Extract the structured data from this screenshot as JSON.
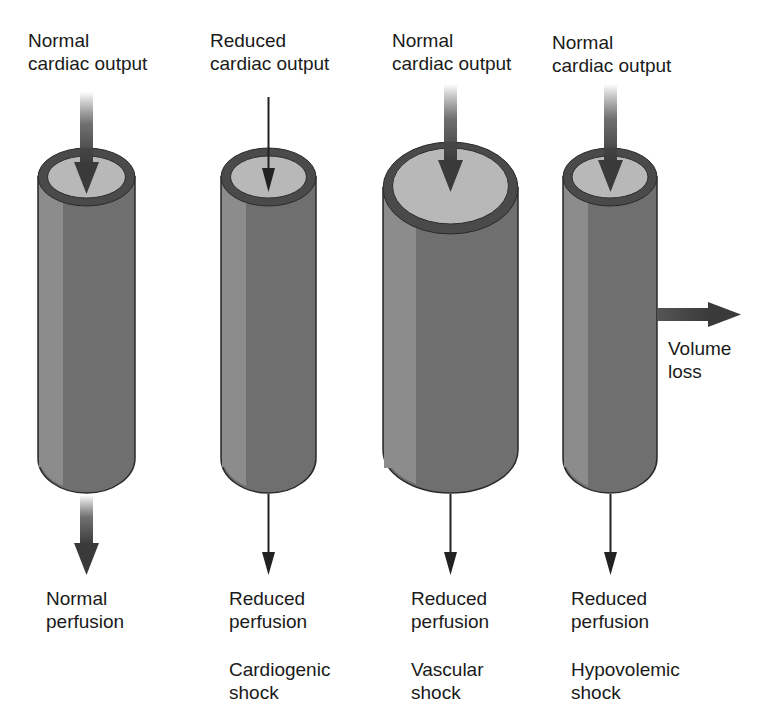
{
  "figure": {
    "type": "diagram",
    "columns": [
      {
        "id": "normal",
        "top_label": [
          "Normal",
          "cardiac output"
        ],
        "bottom_label": [
          "Normal",
          "perfusion"
        ],
        "shock_label": [],
        "vessel": "normal diameter",
        "inflow_arrow": "thick",
        "outflow_arrow": "thick"
      },
      {
        "id": "cardiogenic",
        "top_label": [
          "Reduced",
          "cardiac output"
        ],
        "bottom_label": [
          "Reduced",
          "perfusion"
        ],
        "shock_label": [
          "Cardiogenic",
          "shock"
        ],
        "vessel": "normal diameter",
        "inflow_arrow": "thin",
        "outflow_arrow": "thin"
      },
      {
        "id": "vascular",
        "top_label": [
          "Normal",
          "cardiac output"
        ],
        "bottom_label": [
          "Reduced",
          "perfusion"
        ],
        "shock_label": [
          "Vascular",
          "shock"
        ],
        "vessel": "dilated",
        "inflow_arrow": "thick",
        "outflow_arrow": "thin"
      },
      {
        "id": "hypovolemic",
        "top_label": [
          "Normal",
          "cardiac output"
        ],
        "bottom_label": [
          "Reduced",
          "perfusion"
        ],
        "shock_label": [
          "Hypovolemic",
          "shock"
        ],
        "side_label": [
          "Volume",
          "loss"
        ],
        "vessel": "normal diameter",
        "inflow_arrow": "thick",
        "outflow_arrow": "thin"
      }
    ],
    "colors": {
      "vessel_body": "#6f6f6f",
      "vessel_highlight": "#8c8c8c",
      "vessel_rim": "#4a4a4a",
      "vessel_lumen": "#b8b8b8",
      "arrow": "#3c3c3c",
      "text": "#1a1a1a"
    }
  }
}
